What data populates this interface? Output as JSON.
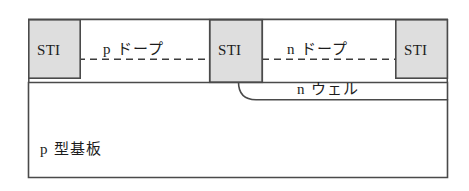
{
  "figure": {
    "type": "semiconductor-cross-section",
    "width": 469,
    "height": 191,
    "background_color": "#ffffff",
    "line_color": "#4a4a4a",
    "text_color": "#1c1c1c",
    "sti_fill_color": "#dedede",
    "substrate_fill_color": "#ffffff"
  },
  "labels": {
    "sti_left": "STI",
    "sti_middle": "STI",
    "sti_right": "STI",
    "p_dope": "p ドープ",
    "n_dope": "n ドープ",
    "n_well": "n ウェル",
    "p_substrate": "p 型基板"
  },
  "geometry": {
    "surface_y": 19,
    "junction_dashed_y": 59,
    "substrate_top_y": 82,
    "substrate_bottom_y": 178,
    "substrate_left_x": 28,
    "substrate_right_x": 448,
    "nwell_bottom_y": 100,
    "sti_left": {
      "x": 28,
      "y": 19,
      "width": 52,
      "height": 59
    },
    "sti_middle": {
      "x": 209,
      "y": 19,
      "width": 53,
      "height": 63
    },
    "sti_right": {
      "x": 395,
      "y": 19,
      "width": 53,
      "height": 59
    }
  }
}
